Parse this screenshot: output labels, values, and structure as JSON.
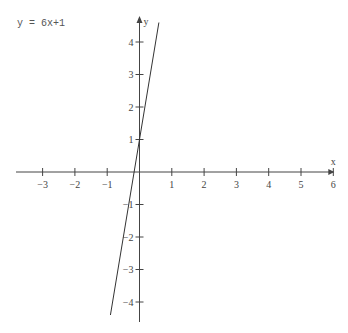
{
  "chart_data": {
    "type": "line",
    "title": "y = 6x+1",
    "xlabel": "x",
    "ylabel": "y",
    "xlim": [
      -3.8,
      6
    ],
    "ylim": [
      -4.6,
      4.7
    ],
    "x_ticks": [
      -3,
      -2,
      -1,
      1,
      2,
      3,
      4,
      5,
      6
    ],
    "y_ticks": [
      -4,
      -3,
      -2,
      -1,
      1,
      2,
      3,
      4
    ],
    "grid": false,
    "series": [
      {
        "name": "y = 6x+1",
        "slope": 6,
        "intercept": 1,
        "x": [
          -0.9,
          0.6
        ],
        "y": [
          -4.4,
          4.6
        ]
      }
    ],
    "colors": {
      "axis": "#444444",
      "line": "#333333",
      "label": "#555555"
    }
  },
  "equation_label": "y = 6x+1"
}
